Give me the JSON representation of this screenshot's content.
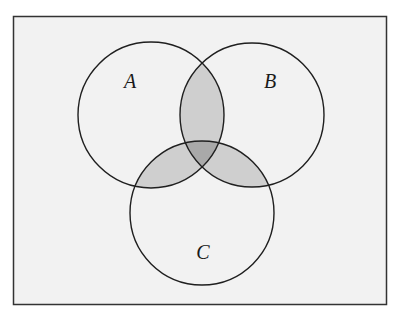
{
  "diagram": {
    "type": "venn",
    "sets": 3,
    "frame": {
      "x": 13,
      "y": 16,
      "width": 374,
      "height": 289,
      "fill": "#f2f2f2",
      "stroke": "#333333"
    },
    "circles": [
      {
        "id": "A",
        "label": "A",
        "cx": 151,
        "cy": 115,
        "r": 73,
        "label_x": 130,
        "label_y": 88
      },
      {
        "id": "B",
        "label": "B",
        "cx": 252,
        "cy": 115,
        "r": 72,
        "label_x": 270,
        "label_y": 88
      },
      {
        "id": "C",
        "label": "C",
        "cx": 202,
        "cy": 213,
        "r": 72,
        "label_x": 203,
        "label_y": 259
      }
    ],
    "shaded_regions": [
      {
        "region": "A∩B",
        "fill": "#cfcfcf"
      },
      {
        "region": "A∩C",
        "fill": "#cfcfcf"
      },
      {
        "region": "B∩C",
        "fill": "#cfcfcf"
      },
      {
        "region": "A∩B∩C",
        "fill": "#a9a9a9"
      }
    ],
    "colors": {
      "background": "#f2f2f2",
      "pairwise": "#cfcfcf",
      "triple": "#a9a9a9",
      "stroke": "#1f1f1f"
    }
  }
}
